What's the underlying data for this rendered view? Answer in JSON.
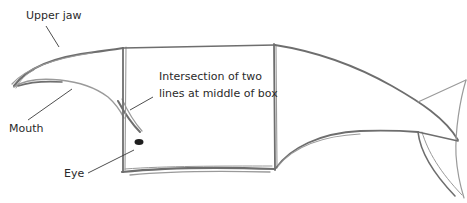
{
  "figure": {
    "labels": {
      "upper_jaw": "Upper jaw",
      "mouth": "Mouth",
      "eye": "Eye",
      "intersection_line1": "Intersection of two",
      "intersection_line2": "lines at middle of box"
    },
    "colors": {
      "pencil": "#6e6e6e",
      "text": "#2a2a2a",
      "eye": "#1e1e1e",
      "background": "#ffffff"
    }
  }
}
